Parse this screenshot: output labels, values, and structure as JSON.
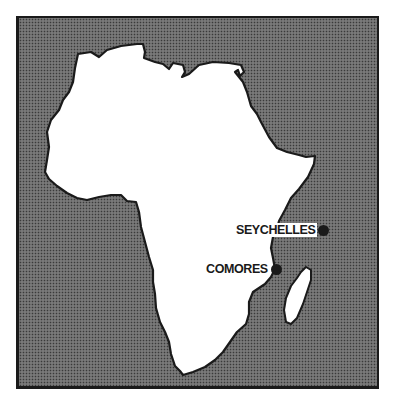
{
  "map": {
    "region": "Africa",
    "colors": {
      "ocean_pattern": "#3a3a3a",
      "ocean_base": "#b8b8b8",
      "land": "#ffffff",
      "coastline": "#1a1a1a",
      "frame": "#1a1a1a"
    },
    "markers": [
      {
        "label": "SEYCHELLES",
        "x": 330,
        "y": 229
      },
      {
        "label": "COMORES",
        "x": 284,
        "y": 267
      }
    ]
  }
}
